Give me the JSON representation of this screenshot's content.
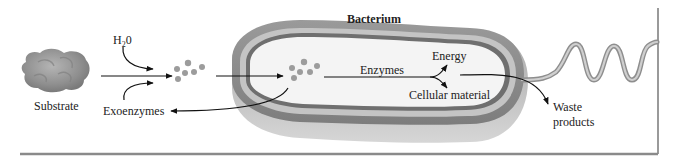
{
  "diagram": {
    "title": "Bacterium",
    "labels": {
      "substrate": "Substrate",
      "water_main": "H",
      "water_sub": "2",
      "water_end": "0",
      "exoenzymes": "Exoenzymes",
      "enzymes": "Enzymes",
      "energy": "Energy",
      "cellular_material": "Cellular material",
      "waste_line1": "Waste",
      "waste_line2": "products"
    },
    "colors": {
      "outer_wall": "#8e8e8e",
      "wall_band": "#b8b8b8",
      "inner_membrane": "#6f6f6f",
      "cytoplasm": "#f4f4f4",
      "substrate": "#9a9a9a",
      "particles": "#9c9c9c",
      "flagellum": "#b5b5b5",
      "arrow": "#111111",
      "frame": "#9a9a9a"
    },
    "flow": [
      "Substrate",
      "broken down by Exoenzymes + H20",
      "small molecules enter Bacterium",
      "Enzymes produce Energy and Cellular material",
      "Waste products released"
    ]
  }
}
